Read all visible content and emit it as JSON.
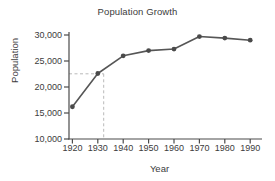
{
  "chart_data": {
    "type": "line",
    "title": "Population Growth",
    "xlabel": "Year",
    "ylabel": "Population",
    "x": [
      1920,
      1930,
      1940,
      1950,
      1960,
      1970,
      1980,
      1990
    ],
    "values": [
      16200,
      22600,
      26000,
      27000,
      27300,
      29700,
      29400,
      29000
    ],
    "series": [
      {
        "name": "Population",
        "values": [
          16200,
          22600,
          26000,
          27000,
          27300,
          29700,
          29400,
          29000
        ]
      }
    ],
    "xlim": [
      1915,
      1995
    ],
    "ylim": [
      10000,
      30000
    ],
    "xticks": [
      1920,
      1930,
      1940,
      1950,
      1960,
      1970,
      1980,
      1990
    ],
    "xtick_labels": [
      "1920",
      "1930",
      "1940",
      "1950",
      "1960",
      "1970",
      "1980",
      "1990"
    ],
    "yticks": [
      10000,
      15000,
      20000,
      25000,
      30000
    ],
    "ytick_labels": [
      "10,000",
      "15,000",
      "20,000",
      "25,000",
      "30,000"
    ],
    "grid": false,
    "legend": "none",
    "marker": "circle",
    "line_color": "#565656",
    "marker_color": "#4a4a4a",
    "axis_color": "#4a4a4a",
    "annotations": [
      {
        "name": "guide-lines",
        "type": "dashed-crosshair",
        "x": 1934,
        "y": 23700,
        "color": "#b9b9b9"
      }
    ]
  }
}
